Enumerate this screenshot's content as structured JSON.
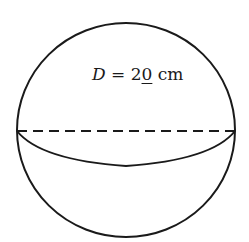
{
  "figure": {
    "shape": "sphere",
    "label": {
      "variable": "D",
      "equals": " = ",
      "value_prefix": "2",
      "value_underlined": "0",
      "unit": " cm"
    },
    "stroke_color": "#1a1a1a",
    "background": "#ffffff"
  }
}
